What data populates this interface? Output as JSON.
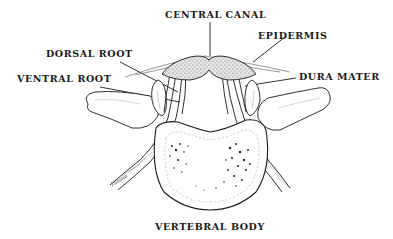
{
  "diagram": {
    "type": "anatomical-illustration",
    "labels": {
      "central_canal": "CENTRAL CANAL",
      "epidermis": "EPIDERMIS",
      "dorsal_root": "DORSAL ROOT",
      "ventral_root": "VENTRAL ROOT",
      "dura_mater": "DURA MATER",
      "vertebral_body": "VERTEBRAL BODY"
    },
    "colors": {
      "ink": "#1a1a1a",
      "stipple": "#555555",
      "background": "#ffffff"
    }
  }
}
